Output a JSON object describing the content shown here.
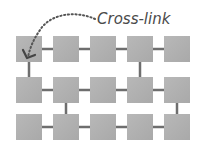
{
  "diagram": {
    "annotation": {
      "label": "Cross-link",
      "color": "#4a4a4a"
    },
    "grid": {
      "rows": 3,
      "cols": 5,
      "col_x": [
        16,
        53,
        90,
        127,
        164
      ],
      "row_y": [
        36,
        77,
        114
      ],
      "square_size": 26,
      "square_color": "#b2b2b2",
      "connector_color": "#6e6e6e",
      "vertical_links": [
        {
          "from_row": 0,
          "to_row": 1,
          "col": 0
        },
        {
          "from_row": 0,
          "to_row": 1,
          "col": 3
        },
        {
          "from_row": 1,
          "to_row": 2,
          "col": 1
        },
        {
          "from_row": 1,
          "to_row": 2,
          "col": 4
        }
      ]
    }
  }
}
